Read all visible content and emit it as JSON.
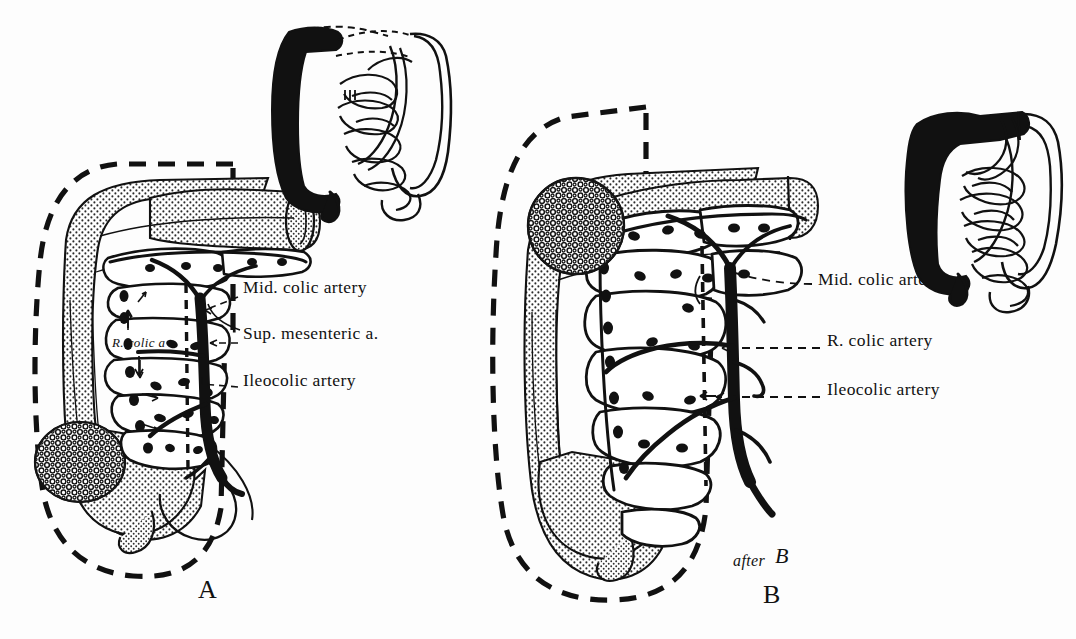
{
  "figure": {
    "background_color": "#fdfdfd",
    "ink_color": "#111111",
    "stipple_color": "#2a2a2a"
  },
  "panels": [
    {
      "id": "panel-a",
      "letter": "A",
      "letter_x": 198,
      "letter_y": 577,
      "tumor_site": "ascending colon",
      "labels": [
        {
          "id": "mid-colic-artery-a",
          "text": "Mid. colic artery",
          "x": 243,
          "y": 288,
          "leader_from_x": 238,
          "leader_from_y": 297,
          "leader_to_x": 197,
          "leader_to_y": 312
        },
        {
          "id": "sup-mesenteric-a",
          "text": "Sup. mesenteric a.",
          "x": 243,
          "y": 334,
          "leader_from_x": 238,
          "leader_from_y": 343,
          "leader_to_x": 203,
          "leader_to_y": 343
        },
        {
          "id": "ileocolic-artery-a",
          "text": "Ileocolic artery",
          "x": 243,
          "y": 381,
          "leader_from_x": 238,
          "leader_from_y": 390,
          "leader_to_x": 196,
          "leader_to_y": 381
        }
      ],
      "inner_labels": [
        {
          "id": "r-colic-a",
          "text": "R. colic a",
          "x": 112,
          "y": 344
        }
      ]
    },
    {
      "id": "panel-b",
      "letter": "B",
      "letter_x": 763,
      "letter_y": 582,
      "tumor_site": "hepatic flexure",
      "labels": [
        {
          "id": "mid-colic-artery-b",
          "text": "Mid. colic artery",
          "x": 818,
          "y": 280,
          "leader_from_x": 812,
          "leader_from_y": 288,
          "leader_to_x": 735,
          "leader_to_y": 276
        },
        {
          "id": "r-colic-artery-b",
          "text": "R. colic artery",
          "x": 827,
          "y": 341,
          "leader_from_x": 822,
          "leader_from_y": 348,
          "leader_to_x": 718,
          "leader_to_y": 348
        },
        {
          "id": "ileocolic-artery-b",
          "text": "Ileocolic artery",
          "x": 827,
          "y": 390,
          "leader_from_x": 822,
          "leader_from_y": 397,
          "leader_to_x": 714,
          "leader_to_y": 397
        }
      ],
      "inner_labels": [],
      "signature": {
        "id": "after-signature",
        "text": "after",
        "monogram": "B",
        "x": 733,
        "y": 562
      }
    }
  ],
  "insets": [
    {
      "id": "inset-a",
      "description": "whole-gut schematic, resected right colon filled black",
      "x": 255,
      "y": 18,
      "width": 190,
      "height": 175
    },
    {
      "id": "inset-b",
      "description": "whole-gut schematic, extended right colon resection filled black",
      "x": 893,
      "y": 110,
      "width": 175,
      "height": 160
    }
  ],
  "legend_notes": {
    "dashed_line_meaning": "line of resection",
    "black_vessels_meaning": "arterial supply ligated",
    "stipple_meaning": "colon wall"
  }
}
